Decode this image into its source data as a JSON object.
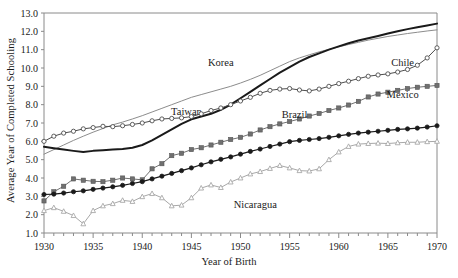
{
  "chart_data": {
    "type": "line",
    "title": "",
    "xlabel": "Year of Birth",
    "ylabel": "Average Year of Completed Schooling",
    "xlim": [
      1930,
      1970
    ],
    "ylim": [
      1.0,
      13.0
    ],
    "ytick_labels": [
      "1.0",
      "2.0",
      "3.0",
      "4.0",
      "5.0",
      "6.0",
      "7.0",
      "8.0",
      "9.0",
      "10.0",
      "11.0",
      "12.0",
      "13.0"
    ],
    "xtick_labels": [
      "1930",
      "1935",
      "1940",
      "1945",
      "1950",
      "1955",
      "1960",
      "1965",
      "1970"
    ],
    "xtick_values": [
      1930,
      1935,
      1940,
      1945,
      1950,
      1955,
      1960,
      1965,
      1970
    ],
    "minor_xticks_every": 1,
    "grid": false,
    "legend_position": "inline-annotations",
    "x": [
      1930,
      1931,
      1932,
      1933,
      1934,
      1935,
      1936,
      1937,
      1938,
      1939,
      1940,
      1941,
      1942,
      1943,
      1944,
      1945,
      1946,
      1947,
      1948,
      1949,
      1950,
      1951,
      1952,
      1953,
      1954,
      1955,
      1956,
      1957,
      1958,
      1959,
      1960,
      1961,
      1962,
      1963,
      1964,
      1965,
      1966,
      1967,
      1968,
      1969,
      1970
    ],
    "series": [
      {
        "name": "Korea",
        "marker": "none",
        "color": "#8c8c8c",
        "line_width": 1.0,
        "label_x": 1948,
        "label_y": 10.1,
        "values": [
          5.3,
          5.55,
          5.8,
          6.05,
          6.28,
          6.5,
          6.7,
          6.9,
          7.05,
          7.22,
          7.4,
          7.6,
          7.8,
          8.0,
          8.2,
          8.4,
          8.55,
          8.7,
          8.85,
          9.0,
          9.18,
          9.38,
          9.6,
          9.85,
          10.1,
          10.35,
          10.55,
          10.72,
          10.88,
          11.02,
          11.15,
          11.28,
          11.4,
          11.52,
          11.62,
          11.72,
          11.8,
          11.88,
          11.95,
          12.02,
          12.08
        ]
      },
      {
        "name": "Taiwan",
        "marker": "none",
        "color": "#1a1a1a",
        "line_width": 2.0,
        "label_x": 1944.5,
        "label_y": 7.45,
        "values": [
          5.7,
          5.62,
          5.55,
          5.48,
          5.42,
          5.48,
          5.52,
          5.55,
          5.58,
          5.65,
          5.8,
          6.05,
          6.35,
          6.65,
          6.95,
          7.2,
          7.35,
          7.5,
          7.72,
          8.0,
          8.35,
          8.7,
          9.05,
          9.4,
          9.75,
          10.05,
          10.35,
          10.6,
          10.8,
          11.0,
          11.18,
          11.35,
          11.5,
          11.62,
          11.75,
          11.88,
          12.0,
          12.12,
          12.22,
          12.32,
          12.42
        ]
      },
      {
        "name": "Chile",
        "marker": "circle-open",
        "color": "#4d4d4d",
        "line_width": 1.0,
        "label_x": 1966.5,
        "label_y": 10.1,
        "values": [
          6.0,
          6.28,
          6.45,
          6.55,
          6.68,
          6.75,
          6.82,
          6.8,
          6.85,
          6.92,
          7.0,
          7.12,
          7.22,
          7.25,
          7.28,
          7.35,
          7.5,
          7.68,
          7.82,
          8.0,
          8.2,
          8.4,
          8.62,
          8.78,
          8.85,
          8.88,
          8.8,
          8.75,
          8.85,
          9.0,
          9.15,
          9.28,
          9.42,
          9.55,
          9.62,
          9.68,
          9.78,
          9.92,
          10.15,
          10.55,
          11.1
        ]
      },
      {
        "name": "Mexico",
        "marker": "square-filled",
        "color": "#707070",
        "line_width": 1.0,
        "label_x": 1966.5,
        "label_y": 8.35,
        "values": [
          2.75,
          3.25,
          3.55,
          3.95,
          3.88,
          3.82,
          3.8,
          3.88,
          4.0,
          3.95,
          3.9,
          4.5,
          4.78,
          5.22,
          5.35,
          5.55,
          5.65,
          5.8,
          5.95,
          6.1,
          6.22,
          6.4,
          6.62,
          6.8,
          6.95,
          7.08,
          7.22,
          7.38,
          7.52,
          7.68,
          7.82,
          7.98,
          8.18,
          8.42,
          8.58,
          8.68,
          8.78,
          8.88,
          8.95,
          9.0,
          9.05
        ]
      },
      {
        "name": "Brazil",
        "marker": "circle-filled",
        "color": "#1a1a1a",
        "line_width": 1.2,
        "label_x": 1955.5,
        "label_y": 7.25,
        "values": [
          3.1,
          3.12,
          3.18,
          3.25,
          3.3,
          3.38,
          3.45,
          3.52,
          3.6,
          3.7,
          3.8,
          3.95,
          4.1,
          4.25,
          4.4,
          4.55,
          4.72,
          4.88,
          5.02,
          5.15,
          5.3,
          5.45,
          5.58,
          5.72,
          5.85,
          5.98,
          6.05,
          6.1,
          6.15,
          6.22,
          6.3,
          6.38,
          6.45,
          6.5,
          6.55,
          6.6,
          6.65,
          6.68,
          6.72,
          6.78,
          6.85
        ]
      },
      {
        "name": "Nicaragua",
        "marker": "triangle-open",
        "color": "#a8a8a8",
        "line_width": 1.0,
        "label_x": 1951.5,
        "label_y": 2.35,
        "values": [
          2.22,
          2.38,
          2.18,
          1.95,
          1.5,
          2.22,
          2.48,
          2.6,
          2.78,
          2.72,
          2.98,
          3.15,
          2.92,
          2.48,
          2.52,
          2.92,
          3.45,
          3.62,
          3.48,
          3.78,
          4.0,
          4.22,
          4.35,
          4.52,
          4.68,
          4.55,
          4.4,
          4.38,
          4.5,
          5.0,
          5.42,
          5.72,
          5.85,
          5.88,
          5.9,
          5.88,
          5.92,
          5.95,
          5.95,
          5.98,
          6.0
        ]
      }
    ]
  }
}
